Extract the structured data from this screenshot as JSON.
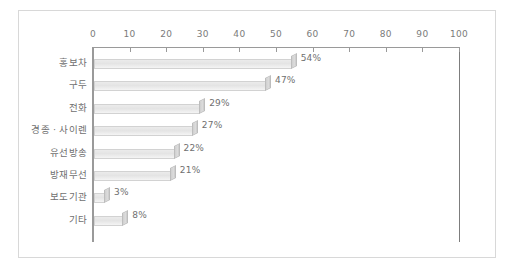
{
  "chart_data": {
    "type": "bar",
    "orientation": "horizontal",
    "title": "",
    "subtitle": "",
    "xlabel": "",
    "ylabel": "",
    "xlim": [
      0,
      100
    ],
    "grid": false,
    "legend": null,
    "axis_position": "top",
    "tick_labels": [
      "0",
      "10",
      "20",
      "30",
      "40",
      "50",
      "60",
      "70",
      "80",
      "90",
      "100"
    ],
    "ticks": [
      0,
      10,
      20,
      30,
      40,
      50,
      60,
      70,
      80,
      90,
      100
    ],
    "categories": [
      "홍보차",
      "구두",
      "전화",
      "경종 · 사이렌",
      "유선방송",
      "방재무선",
      "보도기관",
      "기타"
    ],
    "values": [
      54,
      47,
      29,
      27,
      22,
      21,
      3,
      8
    ],
    "data_labels": [
      "54%",
      "47%",
      "29%",
      "27%",
      "22%",
      "21%",
      "3%",
      "8%"
    ]
  },
  "style": {
    "frame_border_color": "#d8d8d8",
    "axis_color": "#9a9a9a",
    "bar_fill_color": "#e9e9e9",
    "bar_edge_color": "#d2d2d2",
    "bar_cap_color": "#cfcfcf",
    "text_color": "#6f6f6f",
    "background": "#ffffff"
  }
}
